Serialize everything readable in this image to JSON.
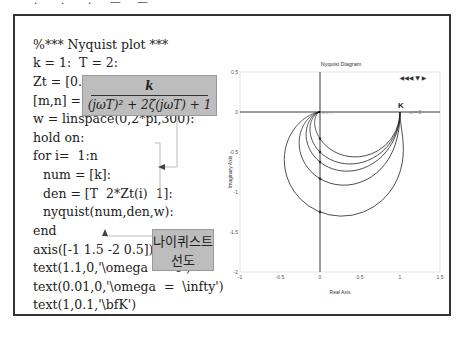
{
  "top_clipped_text": "ㆍ ㆍ ㆍ ㅡ ㅡ",
  "code": {
    "lines": [
      "%*** Nyquist plot ***",
      "k = 1:  T = 2:",
      "Zt = [0.4,0.6,0.8,1.0,1.5]:",
      "[m,n] = size(Zt):",
      "w = linspace(0,2*pi,300):",
      "hold on:",
      "for i=  1:n",
      "num = [k]:",
      "den = [T  2*Zt(i)  1]:",
      "nyquist(num,den,w):",
      "end",
      "axis([-1 1.5 -2 0.5]):",
      "text(1.1,0,'\\omega  =  0')",
      "text(0.01,0,'\\omega  =  \\infty')",
      "text(1,0.1,'\\bfK')"
    ]
  },
  "formula": {
    "numerator": "k",
    "denominator": "(jωT)² + 2ζ(jωT) + 1"
  },
  "callout": {
    "line1": "나이퀴스트",
    "line2": "선도"
  },
  "chart_data": {
    "type": "line",
    "title": "Nyquist Diagram",
    "xlabel": "Real Axis",
    "ylabel": "Imaginary Axis",
    "xlim": [
      -1,
      1.5
    ],
    "ylim": [
      -2,
      0.5
    ],
    "xticks": [
      "-1",
      "-0.5",
      "0",
      "0.5",
      "1",
      "1.5"
    ],
    "yticks": [
      "0.5",
      "0",
      "-0.5",
      "-1",
      "-1.5",
      "-2"
    ],
    "k": 1,
    "T": 2,
    "w_range": [
      0,
      6.2832
    ],
    "w_points": 300,
    "series": [
      {
        "name": "ζ=0.4",
        "zeta": 0.4
      },
      {
        "name": "ζ=0.6",
        "zeta": 0.6
      },
      {
        "name": "ζ=0.8",
        "zeta": 0.8
      },
      {
        "name": "ζ=1.0",
        "zeta": 1.0
      },
      {
        "name": "ζ=1.5",
        "zeta": 1.5
      }
    ],
    "annotations": [
      {
        "text": "K",
        "x": 1,
        "y": 0.1
      },
      {
        "text": "ω = 0",
        "x": 1.1,
        "y": 0
      },
      {
        "text": "ω = ∞",
        "x": 0.01,
        "y": 0
      }
    ],
    "toolbar_glyphs": "◀◀◀ ▼  ▶",
    "grid": false
  }
}
